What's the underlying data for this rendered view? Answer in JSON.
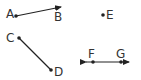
{
  "diagram": {
    "type": "geometry-figures",
    "stroke_color": "#222222",
    "figures": [
      {
        "kind": "ray",
        "name": "ray-AB",
        "points": [
          "A",
          "B"
        ]
      },
      {
        "kind": "point",
        "name": "point-E",
        "points": [
          "E"
        ]
      },
      {
        "kind": "segment",
        "name": "segment-CD",
        "points": [
          "C",
          "D"
        ]
      },
      {
        "kind": "line",
        "name": "line-FG",
        "points": [
          "F",
          "G"
        ]
      }
    ],
    "labels": {
      "A": "A",
      "B": "B",
      "C": "C",
      "D": "D",
      "E": "E",
      "F": "F",
      "G": "G"
    }
  }
}
